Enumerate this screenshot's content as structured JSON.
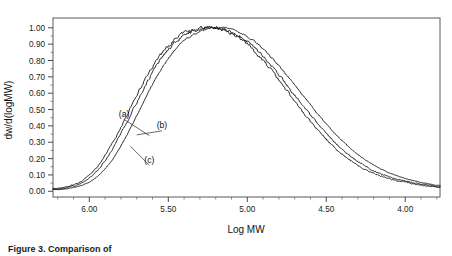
{
  "figure": {
    "caption": "Figure 3.  Comparison of"
  },
  "chart_data": {
    "type": "line",
    "title": "",
    "xlabel": "Log MW",
    "ylabel": "dw/d(logMW)",
    "xlim": [
      6.23,
      3.78
    ],
    "ylim": [
      -0.035,
      1.06
    ],
    "x_reversed": true,
    "grid": false,
    "legend_position": "inline-annotations",
    "xticks": [
      6.0,
      5.5,
      5.0,
      4.5,
      4.0
    ],
    "xtick_labels": [
      "6.00",
      "5.50",
      "5.00",
      "4.50",
      "4.00"
    ],
    "xtick_minor_step": 0.1,
    "yticks": [
      0.0,
      0.1,
      0.2,
      0.3,
      0.4,
      0.5,
      0.6,
      0.7,
      0.8,
      0.9,
      1.0
    ],
    "ytick_labels": [
      "0.00",
      "0.10",
      "0.20",
      "0.30",
      "0.40",
      "0.50",
      "0.60",
      "0.70",
      "0.80",
      "0.90",
      "1.00"
    ],
    "ytick_minor_step": 0.05,
    "annotations": [
      {
        "text": "(a)",
        "x": 5.78,
        "y": 0.455,
        "leader_to_x": 5.62,
        "leader_to_y": 0.34
      },
      {
        "text": "(b)",
        "x": 5.54,
        "y": 0.385,
        "leader_to_x": 5.7,
        "leader_to_y": 0.345
      },
      {
        "text": "(c)",
        "x": 5.62,
        "y": 0.175,
        "leader_to_x": 5.74,
        "leader_to_y": 0.275
      }
    ],
    "series": [
      {
        "name": "(a)",
        "peak_x": 5.72,
        "peak_y": 1.005,
        "noise": 0.009,
        "x": [
          6.2,
          6.15,
          6.1,
          6.05,
          6.0,
          5.95,
          5.9,
          5.85,
          5.8,
          5.75,
          5.7,
          5.65,
          5.6,
          5.55,
          5.5,
          5.45,
          5.4,
          5.35,
          5.3,
          5.25,
          5.2,
          5.15,
          5.1,
          5.05,
          5.0,
          4.95,
          4.9,
          4.85,
          4.8,
          4.75,
          4.7,
          4.65,
          4.6,
          4.55,
          4.5,
          4.45,
          4.4,
          4.35,
          4.3,
          4.25,
          4.2,
          4.15,
          4.1,
          4.05,
          4.0,
          3.95,
          3.9,
          3.85,
          3.8
        ],
        "values": [
          0.018,
          0.026,
          0.04,
          0.062,
          0.098,
          0.15,
          0.218,
          0.3,
          0.393,
          0.49,
          0.588,
          0.68,
          0.762,
          0.833,
          0.89,
          0.935,
          0.967,
          0.988,
          0.999,
          1.003,
          1.0,
          0.988,
          0.967,
          0.938,
          0.9,
          0.854,
          0.8,
          0.742,
          0.68,
          0.616,
          0.552,
          0.489,
          0.428,
          0.371,
          0.318,
          0.27,
          0.228,
          0.191,
          0.159,
          0.132,
          0.11,
          0.092,
          0.077,
          0.065,
          0.055,
          0.046,
          0.038,
          0.031,
          0.025
        ]
      },
      {
        "name": "(b)",
        "peak_x": 5.68,
        "peak_y": 1.0,
        "noise": 0.008,
        "x": [
          6.2,
          6.15,
          6.1,
          6.05,
          6.0,
          5.95,
          5.9,
          5.85,
          5.8,
          5.75,
          5.7,
          5.65,
          5.6,
          5.55,
          5.5,
          5.45,
          5.4,
          5.35,
          5.3,
          5.25,
          5.2,
          5.15,
          5.1,
          5.05,
          5.0,
          4.95,
          4.9,
          4.85,
          4.8,
          4.75,
          4.7,
          4.65,
          4.6,
          4.55,
          4.5,
          4.45,
          4.4,
          4.35,
          4.3,
          4.25,
          4.2,
          4.15,
          4.1,
          4.05,
          4.0,
          3.95,
          3.9,
          3.85,
          3.8
        ],
        "values": [
          0.014,
          0.021,
          0.032,
          0.05,
          0.08,
          0.126,
          0.188,
          0.264,
          0.352,
          0.447,
          0.545,
          0.64,
          0.727,
          0.803,
          0.866,
          0.916,
          0.953,
          0.978,
          0.993,
          1.0,
          0.999,
          0.99,
          0.973,
          0.948,
          0.915,
          0.874,
          0.825,
          0.771,
          0.713,
          0.652,
          0.59,
          0.528,
          0.467,
          0.409,
          0.354,
          0.303,
          0.258,
          0.217,
          0.182,
          0.152,
          0.127,
          0.106,
          0.089,
          0.075,
          0.063,
          0.053,
          0.044,
          0.036,
          0.029
        ]
      },
      {
        "name": "(c)",
        "peak_x": 5.74,
        "peak_y": 1.002,
        "noise": 0.004,
        "x": [
          6.2,
          6.15,
          6.1,
          6.05,
          6.0,
          5.95,
          5.9,
          5.85,
          5.8,
          5.75,
          5.7,
          5.65,
          5.6,
          5.55,
          5.5,
          5.45,
          5.4,
          5.35,
          5.3,
          5.25,
          5.2,
          5.15,
          5.1,
          5.05,
          5.0,
          4.95,
          4.9,
          4.85,
          4.8,
          4.75,
          4.7,
          4.65,
          4.6,
          4.55,
          4.5,
          4.45,
          4.4,
          4.35,
          4.3,
          4.25,
          4.2,
          4.15,
          4.1,
          4.05,
          4.0,
          3.95,
          3.9,
          3.85,
          3.8
        ],
        "values": [
          0.01,
          0.015,
          0.023,
          0.036,
          0.057,
          0.09,
          0.138,
          0.2,
          0.277,
          0.366,
          0.462,
          0.56,
          0.654,
          0.74,
          0.814,
          0.874,
          0.921,
          0.955,
          0.978,
          0.992,
          0.999,
          0.998,
          0.989,
          0.972,
          0.947,
          0.913,
          0.871,
          0.822,
          0.768,
          0.71,
          0.65,
          0.589,
          0.528,
          0.469,
          0.412,
          0.359,
          0.31,
          0.265,
          0.225,
          0.19,
          0.16,
          0.134,
          0.112,
          0.094,
          0.079,
          0.066,
          0.055,
          0.045,
          0.036
        ]
      }
    ]
  }
}
